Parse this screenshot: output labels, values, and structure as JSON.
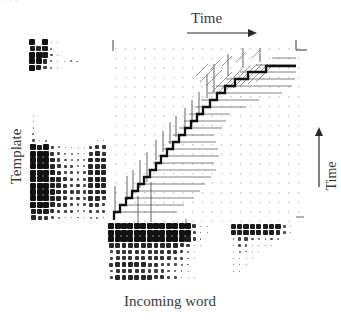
{
  "figure": {
    "kind": "dtw-alignment-diagram",
    "header_clipped_text": "· · ·",
    "background": "#ffffff",
    "ink": "#111111",
    "grid_color": "#cfcfcf"
  },
  "labels": {
    "time_top": "Time",
    "time_right": "Time",
    "template": "Template",
    "incoming_word": "Incoming word"
  },
  "icons": {
    "arrow_right": "arrow-right-icon",
    "arrow_up": "arrow-up-icon",
    "corner_bracket": "corner-bracket-icon",
    "start_tick": "start-tick-icon"
  },
  "plot": {
    "x": 110,
    "y": 40,
    "width": 196,
    "height": 182,
    "grid_dot_spacing": 9.6,
    "grid_dot_size": 1.4,
    "axis_note": "dotted lattice, no numeric tick labels"
  },
  "chart_data": {
    "type": "line",
    "title": "",
    "xlabel": "Incoming word",
    "ylabel": "Template",
    "xlim": [
      0,
      20
    ],
    "ylim": [
      0,
      19
    ],
    "grid": true,
    "legend": "none",
    "series": [
      {
        "name": "DTW warping path",
        "kind": "staircase",
        "x": [
          0.4,
          0.4,
          1.0,
          1.5,
          1.6,
          2.3,
          2.6,
          3.0,
          3.3,
          3.8,
          4.1,
          4.6,
          4.9,
          5.4,
          5.6,
          6.1,
          6.4,
          6.9,
          7.0,
          7.6,
          7.8,
          8.4,
          8.6,
          9.2,
          9.4,
          10.0,
          10.2,
          10.8,
          11.0,
          11.7,
          11.9,
          12.6,
          12.9,
          13.6,
          13.9,
          14.7,
          15.0,
          15.8,
          16.1,
          17.0,
          17.2,
          18.0,
          19.6
        ],
        "y": [
          0.2,
          0.9,
          1.0,
          1.2,
          1.9,
          2.0,
          2.7,
          2.8,
          3.5,
          3.6,
          4.3,
          4.4,
          5.1,
          5.2,
          5.9,
          6.0,
          6.7,
          6.8,
          7.6,
          7.7,
          8.5,
          8.6,
          9.4,
          9.5,
          10.3,
          10.4,
          11.2,
          11.3,
          12.1,
          12.2,
          13.0,
          13.1,
          13.9,
          14.0,
          14.8,
          14.9,
          15.7,
          15.8,
          16.5,
          16.6,
          17.2,
          17.3,
          17.4
        ]
      },
      {
        "name": "horizontal backtrace tails",
        "kind": "segments",
        "count": 22,
        "description": "light horizontal rays extending right from the path"
      },
      {
        "name": "vertical candidate whiskers",
        "kind": "segments",
        "count": 18,
        "description": "light vertical rays extending up from the path"
      },
      {
        "name": "diagonal hatching",
        "kind": "segments",
        "count": 14,
        "description": "short diagonal strokes in the upper-right region"
      }
    ]
  },
  "matrices": [
    {
      "id": "template-top",
      "name": "template-pattern-top",
      "x": 29,
      "y": 39,
      "cols": 8,
      "rows": 5,
      "cell": 6.4,
      "values": [
        [
          9,
          0,
          9,
          2,
          1,
          0,
          0,
          0
        ],
        [
          8,
          7,
          8,
          3,
          0,
          0,
          0,
          0
        ],
        [
          9,
          9,
          8,
          4,
          1,
          0,
          0,
          0
        ],
        [
          9,
          9,
          7,
          3,
          2,
          1,
          3,
          2
        ],
        [
          9,
          8,
          5,
          3,
          1,
          0,
          0,
          0
        ]
      ]
    },
    {
      "id": "template-main",
      "name": "template-pattern-main",
      "x": 30,
      "y": 112,
      "cols": 12,
      "rows": 17,
      "cell": 6.4,
      "values": [
        [
          1,
          0,
          0,
          0,
          0,
          0,
          0,
          0,
          0,
          0,
          0,
          0
        ],
        [
          2,
          0,
          0,
          0,
          0,
          0,
          0,
          0,
          0,
          0,
          0,
          0
        ],
        [
          2,
          0,
          0,
          0,
          0,
          0,
          0,
          0,
          0,
          0,
          0,
          0
        ],
        [
          3,
          0,
          0,
          0,
          0,
          0,
          0,
          0,
          0,
          0,
          0,
          0
        ],
        [
          4,
          1,
          3,
          0,
          0,
          0,
          0,
          0,
          0,
          0,
          2,
          2
        ],
        [
          9,
          8,
          9,
          5,
          3,
          2,
          2,
          1,
          1,
          5,
          6,
          6
        ],
        [
          9,
          9,
          9,
          6,
          4,
          3,
          3,
          2,
          2,
          6,
          7,
          6
        ],
        [
          9,
          9,
          9,
          7,
          5,
          4,
          3,
          3,
          3,
          7,
          7,
          7
        ],
        [
          9,
          9,
          9,
          7,
          6,
          5,
          4,
          3,
          3,
          7,
          7,
          7
        ],
        [
          9,
          9,
          9,
          8,
          6,
          5,
          5,
          4,
          4,
          7,
          8,
          7
        ],
        [
          9,
          9,
          9,
          8,
          7,
          6,
          5,
          4,
          4,
          7,
          8,
          7
        ],
        [
          9,
          9,
          9,
          8,
          7,
          6,
          5,
          5,
          4,
          7,
          8,
          7
        ],
        [
          9,
          9,
          9,
          8,
          7,
          6,
          6,
          5,
          5,
          7,
          7,
          7
        ],
        [
          9,
          9,
          9,
          8,
          7,
          6,
          5,
          5,
          4,
          7,
          7,
          6
        ],
        [
          9,
          9,
          9,
          7,
          6,
          6,
          5,
          4,
          4,
          6,
          6,
          5
        ],
        [
          8,
          8,
          8,
          6,
          5,
          5,
          4,
          3,
          3,
          5,
          5,
          4
        ],
        [
          7,
          6,
          6,
          4,
          3,
          2,
          2,
          2,
          1,
          3,
          3,
          2
        ]
      ]
    },
    {
      "id": "incoming-left",
      "name": "incoming-word-pattern-left",
      "x": 108,
      "y": 223,
      "cols": 16,
      "rows": 9,
      "cell": 6.4,
      "values": [
        [
          9,
          9,
          9,
          9,
          9,
          9,
          9,
          9,
          9,
          9,
          9,
          9,
          9,
          6,
          2,
          1
        ],
        [
          9,
          9,
          9,
          9,
          9,
          9,
          9,
          9,
          9,
          9,
          9,
          9,
          9,
          5,
          2,
          1
        ],
        [
          9,
          9,
          9,
          9,
          9,
          9,
          9,
          9,
          9,
          9,
          9,
          9,
          8,
          5,
          2,
          0
        ],
        [
          7,
          7,
          7,
          7,
          7,
          7,
          7,
          7,
          7,
          7,
          7,
          6,
          5,
          2,
          1,
          0
        ],
        [
          5,
          6,
          6,
          6,
          6,
          6,
          6,
          6,
          6,
          6,
          6,
          5,
          3,
          1,
          0,
          0
        ],
        [
          5,
          6,
          6,
          6,
          6,
          6,
          6,
          6,
          6,
          6,
          5,
          4,
          2,
          1,
          0,
          0
        ],
        [
          6,
          7,
          7,
          7,
          7,
          7,
          6,
          6,
          5,
          5,
          4,
          3,
          2,
          0,
          0,
          0
        ],
        [
          4,
          6,
          6,
          6,
          6,
          6,
          5,
          5,
          5,
          4,
          3,
          2,
          1,
          0,
          0,
          0
        ],
        [
          5,
          7,
          7,
          7,
          7,
          7,
          7,
          6,
          6,
          5,
          4,
          2,
          1,
          1,
          0,
          0
        ]
      ]
    },
    {
      "id": "incoming-right",
      "name": "incoming-word-pattern-right",
      "x": 230,
      "y": 223,
      "cols": 10,
      "rows": 8,
      "cell": 6.4,
      "values": [
        [
          8,
          8,
          8,
          8,
          8,
          8,
          8,
          8,
          4,
          1
        ],
        [
          8,
          8,
          8,
          8,
          8,
          8,
          8,
          7,
          4,
          2
        ],
        [
          2,
          5,
          5,
          4,
          3,
          2,
          4,
          2,
          0,
          0
        ],
        [
          1,
          4,
          4,
          2,
          2,
          1,
          1,
          0,
          0,
          0
        ],
        [
          1,
          3,
          2,
          1,
          1,
          0,
          0,
          0,
          0,
          0
        ],
        [
          1,
          2,
          1,
          1,
          0,
          0,
          0,
          0,
          0,
          0
        ],
        [
          1,
          2,
          1,
          0,
          0,
          0,
          0,
          0,
          0,
          0
        ],
        [
          1,
          1,
          0,
          0,
          0,
          0,
          0,
          0,
          0,
          0
        ]
      ]
    }
  ]
}
